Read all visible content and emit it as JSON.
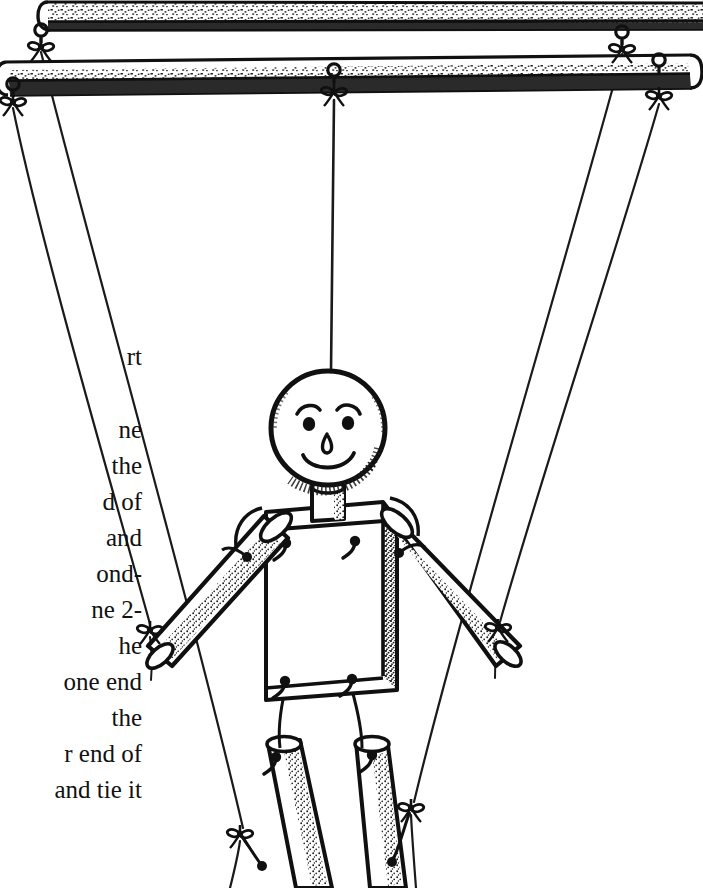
{
  "page": {
    "width": 703,
    "height": 888,
    "background_color": "#ffffff",
    "ink_color": "#111111",
    "kind": "line-art-illustration"
  },
  "instruction_text": {
    "description": "Right-clipped column of body text from a craft instruction book, visible only at the left margin",
    "lines": [
      {
        "text": "rt",
        "y": 362
      },
      {
        "text": "ne",
        "y": 435
      },
      {
        "text": "the",
        "y": 470
      },
      {
        "text": "d of",
        "y": 506
      },
      {
        "text": "and",
        "y": 542
      },
      {
        "text": "ond-",
        "y": 578
      },
      {
        "text": "ne 2-",
        "y": 614
      },
      {
        "text": "he",
        "y": 650
      },
      {
        "text": "one end",
        "y": 686
      },
      {
        "text": "the",
        "y": 722
      },
      {
        "text": "r end of",
        "y": 758
      },
      {
        "text": "and tie it",
        "y": 794
      }
    ]
  },
  "illustration": {
    "title": "Marionette puppet suspended from two wooden control bars",
    "control_bars": [
      {
        "name": "upper-control-bar",
        "label": "Upper wooden control bar",
        "x1": 48,
        "y1": 2,
        "x2": 703,
        "y2": 18,
        "thickness": 26
      },
      {
        "name": "lower-control-bar",
        "label": "Lower wooden control bar",
        "x1": 4,
        "y1": 78,
        "x2": 690,
        "y2": 62,
        "thickness": 30
      }
    ],
    "screw_eyes": [
      {
        "name": "screw-eye-upper-left",
        "x": 41,
        "y": 32
      },
      {
        "name": "screw-eye-upper-right",
        "x": 622,
        "y": 36
      },
      {
        "name": "screw-eye-lower-left",
        "x": 13,
        "y": 86
      },
      {
        "name": "screw-eye-lower-center",
        "x": 334,
        "y": 71
      },
      {
        "name": "screw-eye-lower-right",
        "x": 659,
        "y": 62
      }
    ],
    "bow_knots": [
      {
        "name": "bow-knot-upper-left-bar",
        "x": 41,
        "y": 43
      },
      {
        "name": "bow-knot-upper-right-bar",
        "x": 622,
        "y": 45
      },
      {
        "name": "bow-knot-lower-left-bar",
        "x": 13,
        "y": 100
      },
      {
        "name": "bow-knot-lower-center-bar",
        "x": 334,
        "y": 91
      },
      {
        "name": "bow-knot-lower-right-bar",
        "x": 659,
        "y": 95
      },
      {
        "name": "bow-knot-left-wrist",
        "x": 148,
        "y": 628
      },
      {
        "name": "bow-knot-right-wrist",
        "x": 498,
        "y": 626
      },
      {
        "name": "bow-knot-left-knee",
        "x": 240,
        "y": 832
      },
      {
        "name": "bow-knot-right-knee",
        "x": 411,
        "y": 806
      }
    ],
    "strings": [
      {
        "name": "string-head",
        "from": "screw-eye-lower-center",
        "to": "head-top"
      },
      {
        "name": "string-left-hand",
        "from": "screw-eye-lower-left",
        "to": "left-wrist"
      },
      {
        "name": "string-right-hand",
        "from": "screw-eye-lower-right",
        "to": "right-wrist"
      },
      {
        "name": "string-left-knee",
        "from": "screw-eye-upper-left",
        "to": "left-knee"
      },
      {
        "name": "string-right-knee",
        "from": "screw-eye-upper-right",
        "to": "right-knee"
      }
    ],
    "puppet_parts": [
      {
        "name": "puppet-head",
        "label": "Wooden ball head",
        "cx": 328,
        "cy": 428,
        "r": 57
      },
      {
        "name": "puppet-face-eyebrow-left",
        "label": "Left eyebrow"
      },
      {
        "name": "puppet-face-eyebrow-right",
        "label": "Right eyebrow"
      },
      {
        "name": "puppet-face-eye-left",
        "label": "Left eye"
      },
      {
        "name": "puppet-face-eye-right",
        "label": "Right eye"
      },
      {
        "name": "puppet-face-nose",
        "label": "Nose"
      },
      {
        "name": "puppet-face-mouth",
        "label": "Smiling mouth"
      },
      {
        "name": "puppet-neck-dowel",
        "label": "Neck dowel"
      },
      {
        "name": "puppet-torso",
        "label": "Rectangular block torso"
      },
      {
        "name": "puppet-arm-left",
        "label": "Left arm dowel"
      },
      {
        "name": "puppet-arm-right",
        "label": "Right arm dowel"
      },
      {
        "name": "puppet-leg-left",
        "label": "Left leg dowel"
      },
      {
        "name": "puppet-leg-right",
        "label": "Right leg dowel"
      }
    ],
    "joint_hooks": [
      {
        "name": "hook-shoulder-left",
        "x": 286,
        "y": 546
      },
      {
        "name": "hook-shoulder-right",
        "x": 355,
        "y": 545
      },
      {
        "name": "hook-hip-left",
        "x": 285,
        "y": 684
      },
      {
        "name": "hook-hip-right",
        "x": 352,
        "y": 683
      },
      {
        "name": "hook-arm-left-top",
        "x": 246,
        "y": 561
      },
      {
        "name": "hook-arm-right-top",
        "x": 399,
        "y": 559
      },
      {
        "name": "hook-leg-left-top",
        "x": 276,
        "y": 757
      },
      {
        "name": "hook-leg-right-top",
        "x": 372,
        "y": 755
      }
    ]
  }
}
